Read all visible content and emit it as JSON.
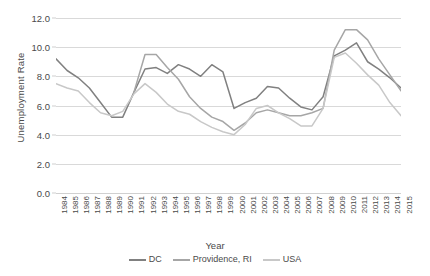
{
  "chart_data": {
    "type": "line",
    "title": "",
    "xlabel": "Year",
    "ylabel": "Unemployment Rate",
    "ylim": [
      0.0,
      12.0
    ],
    "yticks": [
      "0.0",
      "2.0",
      "4.0",
      "6.0",
      "8.0",
      "10.0",
      "12.0"
    ],
    "ytick_values": [
      0.0,
      2.0,
      4.0,
      6.0,
      8.0,
      10.0,
      12.0
    ],
    "grid": true,
    "legend_position": "bottom",
    "categories": [
      "1984",
      "1985",
      "1986",
      "1987",
      "1988",
      "1989",
      "1990",
      "1991",
      "1992",
      "1993",
      "1994",
      "1995",
      "1996",
      "1997",
      "1998",
      "1999",
      "2000",
      "2001",
      "2002",
      "2003",
      "2004",
      "2005",
      "2006",
      "2007",
      "2008",
      "2009",
      "2010",
      "2011",
      "2012",
      "2013",
      "2014",
      "2015"
    ],
    "series": [
      {
        "name": "DC",
        "color": "#808080",
        "values": [
          9.2,
          8.4,
          7.9,
          7.2,
          6.2,
          5.2,
          5.2,
          6.9,
          8.5,
          8.6,
          8.2,
          8.8,
          8.5,
          8.0,
          8.8,
          8.3,
          5.8,
          6.2,
          6.5,
          7.3,
          7.2,
          6.5,
          5.9,
          5.7,
          6.6,
          9.4,
          9.8,
          10.3,
          9.0,
          8.5,
          7.9,
          7.2
        ],
        "marker": "none",
        "linewidth": 1.5
      },
      {
        "name": "Providence, RI",
        "color": "#a6a6a6",
        "values": [
          null,
          null,
          null,
          null,
          null,
          null,
          null,
          6.9,
          9.5,
          9.5,
          8.6,
          7.8,
          6.6,
          5.8,
          5.2,
          4.9,
          4.3,
          4.8,
          5.5,
          5.7,
          5.5,
          5.3,
          5.3,
          5.5,
          5.8,
          9.8,
          11.2,
          11.2,
          10.5,
          9.2,
          8.1,
          7.0
        ],
        "marker": "none",
        "linewidth": 1.5
      },
      {
        "name": "USA",
        "color": "#c8c8c8",
        "values": [
          7.5,
          7.2,
          7.0,
          6.2,
          5.5,
          5.3,
          5.6,
          6.8,
          7.5,
          6.9,
          6.1,
          5.6,
          5.4,
          4.9,
          4.5,
          4.2,
          4.0,
          4.7,
          5.8,
          6.0,
          5.5,
          5.1,
          4.6,
          4.6,
          5.8,
          9.3,
          9.6,
          8.9,
          8.1,
          7.4,
          6.2,
          5.3
        ],
        "marker": "none",
        "linewidth": 1.5
      }
    ],
    "legend": [
      {
        "label": "DC",
        "color": "#808080"
      },
      {
        "label": "Providence, RI",
        "color": "#a6a6a6"
      },
      {
        "label": "USA",
        "color": "#c8c8c8"
      }
    ]
  }
}
